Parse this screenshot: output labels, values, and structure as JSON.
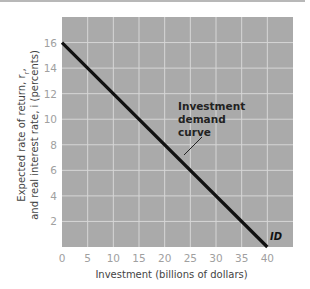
{
  "chart_data": {
    "type": "line",
    "title": "",
    "xlabel": "Investment (billions of dollars)",
    "ylabel_line1": "Expected rate of return, r",
    "ylabel_sub": "r",
    "ylabel_comma": ",",
    "ylabel_line2": "and real interest rate, i (percents)",
    "xlim": [
      0,
      45
    ],
    "ylim": [
      0,
      18
    ],
    "x_ticks": [
      0,
      5,
      10,
      15,
      20,
      25,
      30,
      35,
      40
    ],
    "y_ticks": [
      2,
      4,
      6,
      8,
      10,
      12,
      14,
      16
    ],
    "grid": true,
    "series": [
      {
        "name": "ID",
        "x": [
          0,
          40
        ],
        "y": [
          16,
          0
        ]
      }
    ],
    "annotations": [
      {
        "text_lines": [
          "Investment",
          "demand",
          "curve"
        ],
        "points_to": [
          22,
          8
        ]
      }
    ],
    "series_label": "ID"
  },
  "colors": {
    "plot_background": "#aaaaaa",
    "grid": "#d6d6d6",
    "line": "#111111",
    "tick_text": "#a0a0a0"
  }
}
